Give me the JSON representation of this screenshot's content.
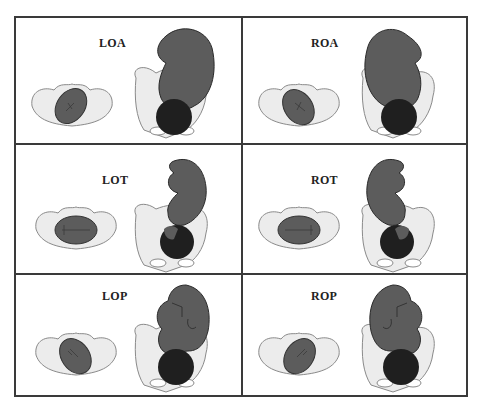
{
  "figure": {
    "colors": {
      "border": "#3a3a3a",
      "pelvis_fill": "#ececec",
      "pelvis_stroke": "#8a8a8a",
      "fetus_body": "#5c5c5c",
      "fetus_head": "#1f1f1f",
      "label": "#222222"
    },
    "panels": [
      {
        "label": "LOA",
        "position": "Left Occiput Anterior",
        "row": 0,
        "col": 0
      },
      {
        "label": "ROA",
        "position": "Right Occiput Anterior",
        "row": 0,
        "col": 1
      },
      {
        "label": "LOT",
        "position": "Left Occiput Transverse",
        "row": 1,
        "col": 0
      },
      {
        "label": "ROT",
        "position": "Right Occiput Transverse",
        "row": 1,
        "col": 1
      },
      {
        "label": "LOP",
        "position": "Left Occiput Posterior",
        "row": 2,
        "col": 0
      },
      {
        "label": "ROP",
        "position": "Right Occiput Posterior",
        "row": 2,
        "col": 1
      }
    ]
  }
}
